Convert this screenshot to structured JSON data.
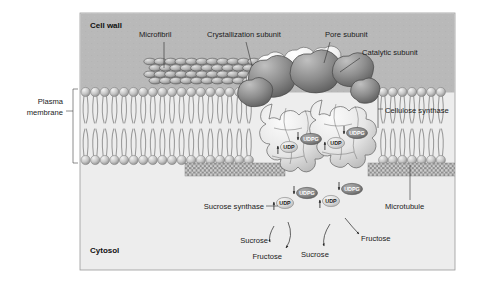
{
  "figure": {
    "kind": "biology-diagram",
    "panel": {
      "x": 80,
      "y": 13,
      "width": 375,
      "height": 257
    }
  },
  "regions": {
    "cell_wall": {
      "label": "Cell wall",
      "x": 90,
      "y": 28,
      "fill": "#b9b9b9"
    },
    "cytosol": {
      "label": "Cytosol",
      "x": 90,
      "y": 253,
      "fill": "#ededed"
    }
  },
  "labels": [
    {
      "name": "microfibril",
      "text": "Microfibril",
      "x": 139,
      "y": 37,
      "anchor": "start"
    },
    {
      "name": "crystallization-subunit",
      "text": "Crystallization subunit",
      "x": 207,
      "y": 37,
      "anchor": "start"
    },
    {
      "name": "pore-subunit",
      "text": "Pore subunit",
      "x": 325,
      "y": 37,
      "anchor": "start"
    },
    {
      "name": "catalytic-subunit",
      "text": "Catalytic subunit",
      "x": 362,
      "y": 55,
      "anchor": "start"
    },
    {
      "name": "cellulose-synthase",
      "text": "Cellulose synthase",
      "x": 385,
      "y": 113,
      "anchor": "start"
    },
    {
      "name": "plasma-membrane-line1",
      "text": "Plasma",
      "x": 63,
      "y": 104,
      "anchor": "end"
    },
    {
      "name": "plasma-membrane-line2",
      "text": "membrane",
      "x": 63,
      "y": 115,
      "anchor": "end"
    },
    {
      "name": "sucrose-synthase",
      "text": "Sucrose synthase",
      "x": 264,
      "y": 209,
      "anchor": "end"
    },
    {
      "name": "microtubule",
      "text": "Microtubule",
      "x": 385,
      "y": 209,
      "anchor": "start"
    },
    {
      "name": "sucrose-left",
      "text": "Sucrose",
      "x": 268,
      "y": 243,
      "anchor": "end"
    },
    {
      "name": "fructose-left",
      "text": "Fructose",
      "x": 282,
      "y": 259,
      "anchor": "end"
    },
    {
      "name": "sucrose-right",
      "text": "Sucrose",
      "x": 301,
      "y": 257,
      "anchor": "start"
    },
    {
      "name": "fructose-right",
      "text": "Fructose",
      "x": 361,
      "y": 241,
      "anchor": "start"
    }
  ],
  "molecules": {
    "udpg_label": "UDPG",
    "udp_label": "UDP",
    "udpg_fill": "#8b8b8b",
    "udpg_text": "#ffffff",
    "udp_fill": "#d8d8d8",
    "udp_text": "#1a1a1a",
    "upper": [
      {
        "kind": "UDP",
        "x": 289,
        "y": 147
      },
      {
        "kind": "UDPG",
        "x": 311,
        "y": 139
      },
      {
        "kind": "UDP",
        "x": 336,
        "y": 143
      },
      {
        "kind": "UDPG",
        "x": 357,
        "y": 133
      }
    ],
    "lower": [
      {
        "kind": "UDP",
        "x": 285,
        "y": 203
      },
      {
        "kind": "UDPG",
        "x": 307,
        "y": 193
      },
      {
        "kind": "UDP",
        "x": 331,
        "y": 201
      },
      {
        "kind": "UDPG",
        "x": 352,
        "y": 189
      }
    ]
  },
  "colors": {
    "panel_border": "#9a9a9a",
    "cell_wall": "#b9b9b9",
    "cytosol": "#ededed",
    "lipid_head": "#c9c9c9",
    "lipid_head_dark": "#9a9a9a",
    "lipid_tail": "#9a9a9a",
    "microfibril": "#b0b0b0",
    "microfibril_stroke": "#4f4f4f",
    "crystallization": "#f4f4f4",
    "pore": "#8e8e8e",
    "catalytic": "#e8e8e8",
    "microtubule": "#a8a8a8",
    "leader": "#333333"
  },
  "membrane": {
    "top_y": 92,
    "bottom_y": 160,
    "head_r": 4.6,
    "spacing": 9.6
  },
  "microfibril_band": {
    "x": 150,
    "y": 58,
    "width": 120,
    "height": 26
  },
  "microtubule_bands": [
    {
      "x": 185,
      "y": 163,
      "width": 100,
      "height": 13
    },
    {
      "x": 368,
      "y": 163,
      "width": 87,
      "height": 13
    }
  ]
}
